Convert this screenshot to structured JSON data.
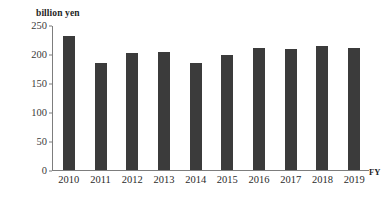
{
  "chart_data": {
    "type": "bar",
    "title": "",
    "subtitle": "",
    "unit_label": "billion yen",
    "xlabel": "FY",
    "ylabel": "billion yen",
    "categories": [
      "2010",
      "2011",
      "2012",
      "2013",
      "2014",
      "2015",
      "2016",
      "2017",
      "2018",
      "2019"
    ],
    "values": [
      231,
      185,
      202,
      204,
      184,
      198,
      210,
      209,
      213,
      211
    ],
    "series": [
      {
        "name": "billion yen",
        "values": [
          231,
          185,
          202,
          204,
          184,
          198,
          210,
          209,
          213,
          211
        ]
      }
    ],
    "ylim": [
      0,
      250
    ],
    "yticks": [
      250,
      200,
      150,
      100,
      50,
      0
    ],
    "ytick_labels": [
      "250",
      "200",
      "150",
      "100",
      "50",
      "0"
    ],
    "xtick_labels": [
      "2010",
      "2011",
      "2012",
      "2013",
      "2014",
      "2015",
      "2016",
      "2017",
      "2018",
      "2019"
    ],
    "grid": false,
    "legend": false,
    "legend_position": "none",
    "bar_color": "#3b3b3b",
    "axis_color": "#7d7d7d",
    "background_color": "#ffffff"
  },
  "axes": {
    "y_axis_name": "value-axis",
    "x_axis_name": "fiscal-year-axis",
    "x_axis_caption": "FY",
    "unit_caption": "billion yen"
  }
}
